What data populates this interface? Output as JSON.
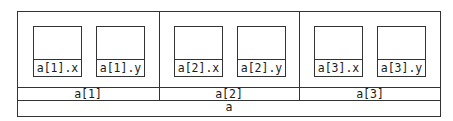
{
  "diagram": {
    "root": {
      "label": "a"
    },
    "elements": [
      {
        "label": "a[1]",
        "fields": [
          {
            "label": "a[1].x"
          },
          {
            "label": "a[1].y"
          }
        ]
      },
      {
        "label": "a[2]",
        "fields": [
          {
            "label": "a[2].x"
          },
          {
            "label": "a[2].y"
          }
        ]
      },
      {
        "label": "a[3]",
        "fields": [
          {
            "label": "a[3].x"
          },
          {
            "label": "a[3].y"
          }
        ]
      }
    ]
  }
}
